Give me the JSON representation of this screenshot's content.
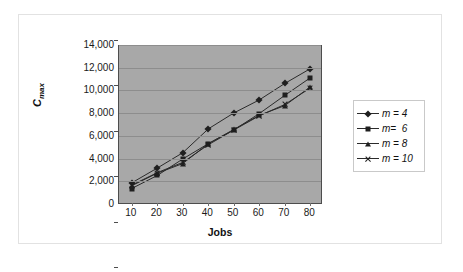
{
  "chart_data": {
    "type": "line",
    "title": "",
    "xlabel": "Jobs",
    "ylabel": "C_max",
    "ylabel_base": "C",
    "ylabel_sub": "max",
    "categories": [
      10,
      20,
      30,
      40,
      50,
      60,
      70,
      80
    ],
    "x_tick_labels": [
      "10",
      "20",
      "30",
      "40",
      "50",
      "60",
      "70",
      "80"
    ],
    "y_tick_labels": [
      "14,000",
      "12,000",
      "10,000",
      "8,000",
      "6,000",
      "4,000",
      "2,000",
      "0"
    ],
    "y_tick_values": [
      14000,
      12000,
      10000,
      8000,
      6000,
      4000,
      2000,
      0
    ],
    "ylim": [
      0,
      14000
    ],
    "xlim": [
      10,
      80
    ],
    "grid": true,
    "legend_position": "right",
    "plot_background": "#a8a8a8",
    "line_color": "#2b2b2b",
    "marker_color": "#1f1f1f",
    "series": [
      {
        "name": "m = 4",
        "marker": "diamond",
        "values": [
          1950,
          3250,
          4600,
          6700,
          8100,
          9250,
          10700,
          12000
        ]
      },
      {
        "name": "m=  6",
        "marker": "square",
        "values": [
          1450,
          2600,
          4050,
          5400,
          6600,
          8050,
          9650,
          11200
        ]
      },
      {
        "name": "m = 8",
        "marker": "triangle",
        "values": [
          1700,
          2800,
          3650,
          5400,
          6650,
          7900,
          8750,
          10400
        ]
      },
      {
        "name": "m = 10",
        "marker": "x",
        "values": [
          1750,
          2850,
          3750,
          5300,
          6600,
          7850,
          8850,
          10300
        ]
      }
    ]
  }
}
